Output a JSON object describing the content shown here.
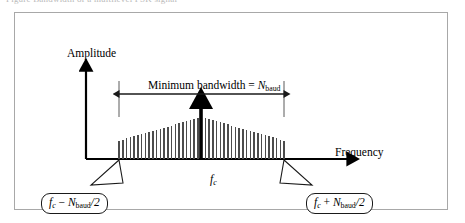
{
  "figure": {
    "caption_sliver": "Figure    Bandwidth of a multilevel FSK signal",
    "frame_color": "#a8a8a8",
    "background": "#ffffff",
    "ink_color": "#000000"
  },
  "axes": {
    "y_label": "Amplitude",
    "x_label": "Frequency",
    "y_axis_arrow": true,
    "x_axis_arrow": true
  },
  "annotations": {
    "bandwidth_prefix": "Minimum bandwidth = ",
    "bandwidth_symbol": "N",
    "bandwidth_subscript": "baud",
    "center_symbol": "f",
    "center_subscript": "c"
  },
  "callouts": [
    {
      "name": "lower-edge-frequency",
      "symbol": "f",
      "symbol_sub": "c",
      "operator": " − ",
      "term_symbol": "N",
      "term_sub": "baud",
      "divisor": "/2",
      "text": "fc − Nbaud/2"
    },
    {
      "name": "upper-edge-frequency",
      "symbol": "f",
      "symbol_sub": "c",
      "operator": " + ",
      "term_symbol": "N",
      "term_sub": "baud",
      "divisor": "/2",
      "text": "fc + Nbaud/2"
    }
  ],
  "chart_data": {
    "type": "bar",
    "xlabel": "Frequency",
    "ylabel": "Amplitude",
    "grid": false,
    "legend": null,
    "envelope": "triangular",
    "n_lines": 45,
    "x_axis_range_labels": [
      "f_c − N_baud/2",
      "f_c",
      "f_c + N_baud/2"
    ],
    "carrier_index": 22,
    "carrier_emphasized": true,
    "categories": [
      "-22",
      "-21",
      "-20",
      "-19",
      "-18",
      "-17",
      "-16",
      "-15",
      "-14",
      "-13",
      "-12",
      "-11",
      "-10",
      "-9",
      "-8",
      "-7",
      "-6",
      "-5",
      "-4",
      "-3",
      "-2",
      "-1",
      "0",
      "1",
      "2",
      "3",
      "4",
      "5",
      "6",
      "7",
      "8",
      "9",
      "10",
      "11",
      "12",
      "13",
      "14",
      "15",
      "16",
      "17",
      "18",
      "19",
      "20",
      "21",
      "22"
    ],
    "values": [
      34,
      36,
      38,
      40,
      42,
      44,
      46,
      48,
      50,
      52,
      54,
      56,
      58,
      60,
      62,
      64,
      66,
      68,
      70,
      72,
      74,
      76,
      100,
      76,
      74,
      72,
      70,
      68,
      66,
      64,
      62,
      60,
      58,
      56,
      54,
      52,
      50,
      48,
      46,
      44,
      42,
      40,
      38,
      36,
      34
    ],
    "ylim": [
      0,
      100
    ]
  }
}
